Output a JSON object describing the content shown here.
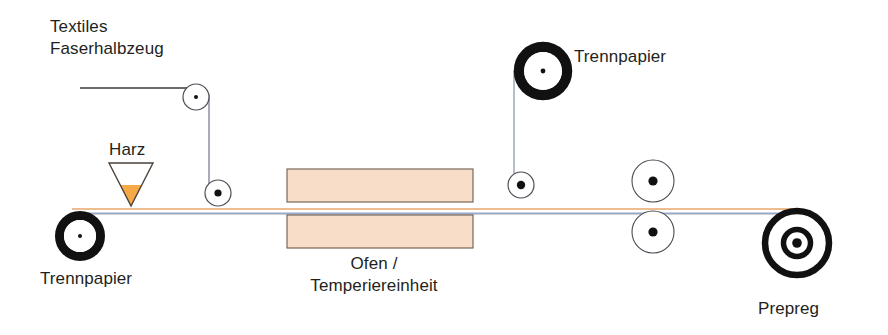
{
  "diagram": {
    "width": 888,
    "height": 335,
    "background_color": "#ffffff"
  },
  "labels": {
    "textiles_line1": "Textiles",
    "textiles_line2": "Faserhalbzeug",
    "harz": "Harz",
    "trennpapier_left": "Trennpapier",
    "trennpapier_top": "Trennpapier",
    "ofen_line1": "Ofen /",
    "ofen_line2": "Temperiereinheit",
    "prepreg": "Prepreg"
  },
  "colors": {
    "text": "#231f20",
    "line_dark": "#3a3a3a",
    "roll_black": "#111111",
    "oven_fill": "#f8ddc8",
    "oven_border": "#6b5b4b",
    "resin_fill": "#f5a947",
    "funnel_outline": "#4a4038",
    "web_resin_line": "#e8a76a",
    "web_paper_line": "#98a8c8",
    "roller_outline": "#4b4b55",
    "roller_hub": "#111111"
  },
  "components": {
    "supply_roll_left": {
      "name": "Trennpapier-Abwickelrolle links",
      "cx": 80,
      "cy": 236,
      "outer_r": 25,
      "ring_width": 9,
      "hub_r": 2
    },
    "supply_roll_top": {
      "name": "Trennpapier-Abwickelrolle oben",
      "cx": 543,
      "cy": 71,
      "outer_r": 29,
      "ring_width": 10,
      "hub_r": 2.5
    },
    "wind_up_roll": {
      "name": "Prepreg-Aufwickelrolle",
      "cx": 797,
      "cy": 243,
      "outer_r": 35,
      "ring_width": 6,
      "inner_ring_r": 15,
      "inner_ring_width": 5,
      "hub_r": 5
    },
    "rollers": [
      {
        "name": "Umlenkrolle textil oben",
        "cx": 196,
        "cy": 97,
        "r": 13,
        "hub_r": 2
      },
      {
        "name": "Umlenkrolle textil unten",
        "cx": 218,
        "cy": 193,
        "r": 13,
        "hub_r": 3.5
      },
      {
        "name": "Umlenkrolle Trennpapier oben",
        "cx": 521,
        "cy": 185,
        "r": 13,
        "hub_r": 4
      },
      {
        "name": "Kalanderwalze oben",
        "cx": 653,
        "cy": 181,
        "r": 21,
        "hub_r": 4.5
      },
      {
        "name": "Kalanderwalze unten",
        "cx": 653,
        "cy": 232,
        "r": 21,
        "hub_r": 4.5
      }
    ],
    "oven_blocks": [
      {
        "name": "Ofen oben",
        "x": 287,
        "y": 169,
        "width": 186,
        "height": 33
      },
      {
        "name": "Ofen unten",
        "x": 287,
        "y": 215,
        "width": 186,
        "height": 33
      }
    ],
    "resin_funnel": {
      "name": "Harztrichter",
      "apex_x": 131,
      "apex_y": 205,
      "top_y": 163,
      "half_width": 22,
      "fill_top_y": 185
    },
    "webs": [
      {
        "name": "Textilbahn horizontal",
        "x1": 80,
        "y1": 88,
        "x2": 196,
        "y2": 88
      },
      {
        "name": "Textilbahn vertikal",
        "x1": 209,
        "y1": 97,
        "x2": 209,
        "y2": 185
      },
      {
        "name": "Trennpapierbahn oben vertikal",
        "x1": 514,
        "y1": 71,
        "x2": 514,
        "y2": 180
      },
      {
        "name": "Prozessbahn Harz",
        "x1": 80,
        "y1": 209,
        "x2": 797,
        "y2": 209
      },
      {
        "name": "Prozessbahn Trennpapier",
        "x1": 80,
        "y1": 213,
        "x2": 797,
        "y2": 213
      }
    ]
  }
}
